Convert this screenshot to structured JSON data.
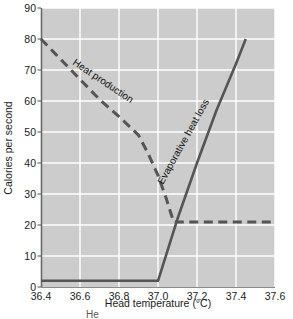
{
  "chart_data": {
    "type": "line",
    "title": "",
    "xlabel": "Head temperature (°C)",
    "ylabel": "Calories per second",
    "xlim": [
      36.4,
      37.6
    ],
    "ylim": [
      0,
      90
    ],
    "xticks": [
      "36.4",
      "36.6",
      "36.8",
      "37.0",
      "37.2",
      "37.4",
      "37.6"
    ],
    "xtick_values": [
      36.4,
      36.6,
      36.8,
      37.0,
      37.2,
      37.4,
      37.6
    ],
    "yticks": [
      "0",
      "10",
      "20",
      "30",
      "40",
      "50",
      "60",
      "70",
      "80",
      "90"
    ],
    "ytick_values": [
      0,
      10,
      20,
      30,
      40,
      50,
      60,
      70,
      80,
      90
    ],
    "grid": true,
    "grid_color": "#ffffff",
    "plot_bgcolor": "#cccccc",
    "line_color": "#555555",
    "legend": "inline-labels",
    "series": [
      {
        "name": "Heat production",
        "style": "dashed",
        "label_text": "Heat production",
        "points": [
          {
            "x": 36.4,
            "y": 80.0
          },
          {
            "x": 36.5,
            "y": 73.5
          },
          {
            "x": 36.6,
            "y": 67.0
          },
          {
            "x": 36.7,
            "y": 60.5
          },
          {
            "x": 36.8,
            "y": 55.0
          },
          {
            "x": 36.9,
            "y": 49.0
          },
          {
            "x": 36.95,
            "y": 43.0
          },
          {
            "x": 37.0,
            "y": 36.0
          },
          {
            "x": 37.04,
            "y": 29.0
          },
          {
            "x": 37.08,
            "y": 21.0
          },
          {
            "x": 37.2,
            "y": 21.0
          },
          {
            "x": 37.4,
            "y": 21.0
          },
          {
            "x": 37.6,
            "y": 21.0
          }
        ]
      },
      {
        "name": "Evaporative heat loss",
        "style": "solid",
        "label_text": "Evaporative heat loss",
        "points": [
          {
            "x": 36.4,
            "y": 2.0
          },
          {
            "x": 36.6,
            "y": 2.0
          },
          {
            "x": 36.8,
            "y": 2.0
          },
          {
            "x": 37.0,
            "y": 2.0
          },
          {
            "x": 37.05,
            "y": 12.0
          },
          {
            "x": 37.1,
            "y": 22.0
          },
          {
            "x": 37.2,
            "y": 40.0
          },
          {
            "x": 37.3,
            "y": 57.0
          },
          {
            "x": 37.4,
            "y": 72.0
          },
          {
            "x": 37.45,
            "y": 80.0
          }
        ]
      }
    ],
    "annotations": [
      {
        "name": "heat-production-label",
        "text": "Heat production"
      },
      {
        "name": "evaporative-heat-loss-label",
        "text": "Evaporative heat loss"
      }
    ]
  },
  "caption": {
    "fragment": "He"
  }
}
